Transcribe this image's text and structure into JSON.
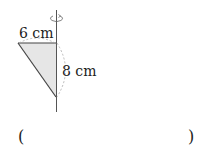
{
  "figure": {
    "labels": {
      "top_leg": "6 cm",
      "vertical_leg": "8 cm"
    },
    "colors": {
      "fill": "#e6e6e6",
      "stroke": "#444444",
      "dashed": "#aaaaaa"
    }
  },
  "answer": {
    "open_paren": "(",
    "close_paren": ")"
  }
}
